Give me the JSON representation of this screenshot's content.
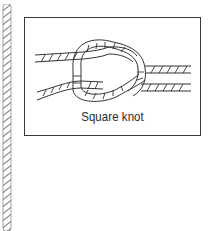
{
  "figure": {
    "caption": "Square knot",
    "colors": {
      "rope_border": "#8a8a8a",
      "frame_border": "#3a3a3a",
      "line": "#333333",
      "background": "#ffffff"
    }
  }
}
